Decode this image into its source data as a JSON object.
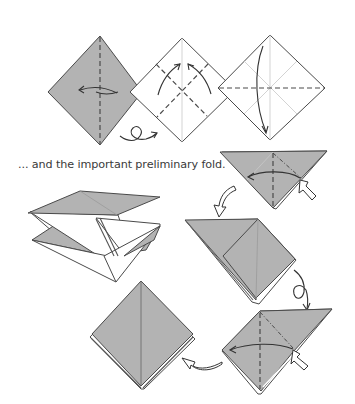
{
  "diagram": {
    "caption": "... and the important preliminary fold.",
    "colors": {
      "paper_colored": "#b3b3b3",
      "paper_white": "#ffffff",
      "line": "#4a4a4a",
      "crease": "#9a9a9a"
    },
    "steps": [
      {
        "id": 1,
        "shape": "gray square on point",
        "action": "valley fold in half left (dashed vertical line)",
        "symbol": "turn-over-arrow"
      },
      {
        "id": 2,
        "shape": "white square on point",
        "action": "valley fold diagonals, fold corners up",
        "symbol": "two curved arrows"
      },
      {
        "id": 3,
        "shape": "white square on point with creases",
        "action": "valley fold top down to bottom (dashed horizontal)",
        "symbol": "curved arrow down"
      },
      {
        "id": 4,
        "shape": "gray triangle",
        "action": "squash fold (mountain dash-dot, hollow push arrow)",
        "symbol": "push arrow"
      },
      {
        "id": 5,
        "shape": "3D preliminary fold in progress",
        "action": "collapse",
        "symbol": ""
      },
      {
        "id": 6,
        "shape": "partially squashed kite",
        "action": "turn over",
        "symbol": "turn-over-arrow"
      },
      {
        "id": 7,
        "shape": "gray kite with flap",
        "action": "squash fold remaining flap",
        "symbol": "push arrow"
      },
      {
        "id": 8,
        "shape": "finished preliminary fold (gray square on point)",
        "action": "result",
        "symbol": ""
      }
    ]
  }
}
